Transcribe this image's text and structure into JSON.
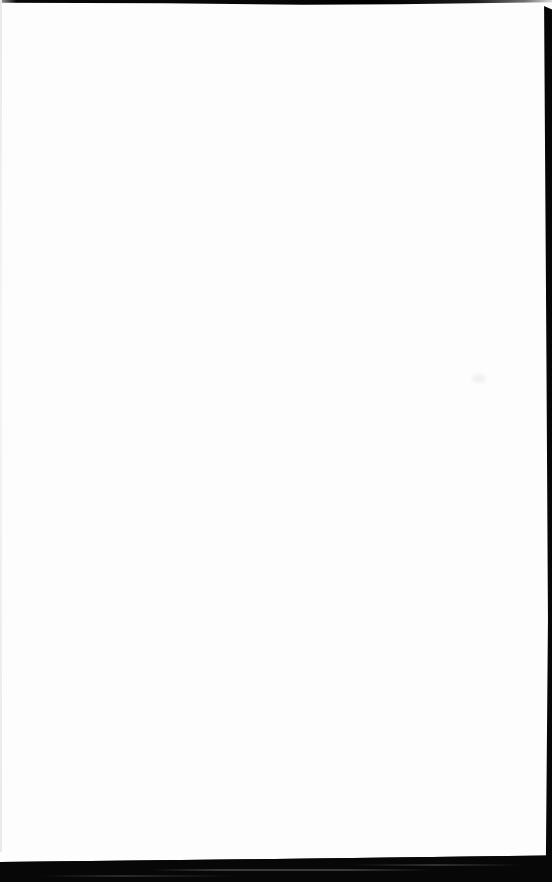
{
  "document": {
    "kind": "scanned-blank-page",
    "visible_text": ""
  },
  "colors": {
    "page-bg": "#fdfdfd",
    "scan-edge": "#070707",
    "edge-fade": "#9a9a9a",
    "left-line": "#e9e9e9",
    "streak": "#3a3a3a",
    "smudge": "#f1f1f1"
  }
}
